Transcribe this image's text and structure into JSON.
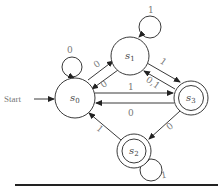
{
  "diagram": {
    "type": "finite-state-automaton",
    "start_label": "Start",
    "states": [
      {
        "id": "s0",
        "name": "s",
        "sub": "0",
        "accepting": false,
        "start": true
      },
      {
        "id": "s1",
        "name": "s",
        "sub": "1",
        "accepting": false,
        "start": false
      },
      {
        "id": "s2",
        "name": "s",
        "sub": "2",
        "accepting": true,
        "start": false
      },
      {
        "id": "s3",
        "name": "s",
        "sub": "3",
        "accepting": true,
        "start": false
      }
    ],
    "transitions": [
      {
        "from": "s0",
        "to": "s0",
        "label": "0"
      },
      {
        "from": "s0",
        "to": "s1",
        "label": "0"
      },
      {
        "from": "s1",
        "to": "s0",
        "label": "0"
      },
      {
        "from": "s1",
        "to": "s1",
        "label": "1"
      },
      {
        "from": "s1",
        "to": "s3",
        "label": "1"
      },
      {
        "from": "s3",
        "to": "s1",
        "label": "0,1"
      },
      {
        "from": "s0",
        "to": "s3",
        "label": "1"
      },
      {
        "from": "s3",
        "to": "s0",
        "label": "0"
      },
      {
        "from": "s3",
        "to": "s2",
        "label": "0"
      },
      {
        "from": "s2",
        "to": "s0",
        "label": "1"
      },
      {
        "from": "s2",
        "to": "s2",
        "label": "1"
      }
    ],
    "colors": {
      "stroke": "#3a3a3a",
      "label": "#777777",
      "rule": "#222222"
    }
  }
}
